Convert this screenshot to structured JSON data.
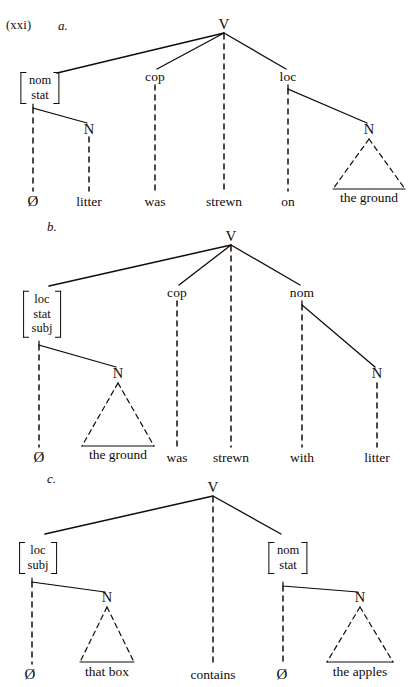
{
  "figure": {
    "example_number": "(xxi)",
    "domain": "syntax-tree-diagram",
    "ink_color": "#100c0a"
  },
  "trees": [
    {
      "letter": "a.",
      "sentence": "Ø litter was strewn on the ground",
      "root": {
        "label": "V",
        "x": 224,
        "y": 26
      },
      "nodes": [
        {
          "id": "a-nom-stat",
          "type": "feature-matrix",
          "features": [
            "nom",
            "stat"
          ],
          "x": 40,
          "y": 88
        },
        {
          "id": "a-cop",
          "type": "category",
          "label": "cop",
          "x": 155,
          "y": 79
        },
        {
          "id": "a-loc",
          "type": "category",
          "label": "loc",
          "x": 288,
          "y": 79
        },
        {
          "id": "a-n-litter",
          "type": "category",
          "label": "N",
          "x": 89,
          "y": 131
        },
        {
          "id": "a-n-ground",
          "type": "category",
          "label": "N",
          "x": 369,
          "y": 131
        }
      ],
      "terminals": [
        {
          "id": "a-t1",
          "text": "Ø",
          "x": 33,
          "y": 201,
          "triangle": false
        },
        {
          "id": "a-t2",
          "text": "litter",
          "x": 89,
          "y": 201,
          "triangle": false
        },
        {
          "id": "a-t3",
          "text": "was",
          "x": 155,
          "y": 201,
          "triangle": false
        },
        {
          "id": "a-t4",
          "text": "strewn",
          "x": 224,
          "y": 201,
          "triangle": false
        },
        {
          "id": "a-t5",
          "text": "on",
          "x": 288,
          "y": 201,
          "triangle": false
        },
        {
          "id": "a-t6",
          "text": "the ground",
          "x": 369,
          "y": 201,
          "triangle": true
        }
      ]
    },
    {
      "letter": "b.",
      "sentence": "Ø the ground was strewn with litter",
      "root": {
        "label": "V",
        "x": 231,
        "y": 238
      },
      "nodes": [
        {
          "id": "b-loc-stat-subj",
          "type": "feature-matrix",
          "features": [
            "loc",
            "stat",
            "subj"
          ],
          "x": 42,
          "y": 314
        },
        {
          "id": "b-cop",
          "type": "category",
          "label": "cop",
          "x": 177,
          "y": 295
        },
        {
          "id": "b-nom",
          "type": "category",
          "label": "nom",
          "x": 302,
          "y": 295
        },
        {
          "id": "b-n-ground",
          "type": "category",
          "label": "N",
          "x": 118,
          "y": 375
        },
        {
          "id": "b-n-litter",
          "type": "category",
          "label": "N",
          "x": 377,
          "y": 375
        }
      ],
      "terminals": [
        {
          "id": "b-t1",
          "text": "Ø",
          "x": 39,
          "y": 457,
          "triangle": false
        },
        {
          "id": "b-t2",
          "text": "the ground",
          "x": 118,
          "y": 457,
          "triangle": true
        },
        {
          "id": "b-t3",
          "text": "was",
          "x": 177,
          "y": 457,
          "triangle": false
        },
        {
          "id": "b-t4",
          "text": "strewn",
          "x": 231,
          "y": 457,
          "triangle": false
        },
        {
          "id": "b-t5",
          "text": "with",
          "x": 302,
          "y": 457,
          "triangle": false
        },
        {
          "id": "b-t6",
          "text": "litter",
          "x": 377,
          "y": 457,
          "triangle": false
        }
      ]
    },
    {
      "letter": "c.",
      "sentence": "Ø that box contains Ø the apples",
      "root": {
        "label": "V",
        "x": 213,
        "y": 489
      },
      "nodes": [
        {
          "id": "c-loc-subj",
          "type": "feature-matrix",
          "features": [
            "loc",
            "subj"
          ],
          "x": 38,
          "y": 558
        },
        {
          "id": "c-nom-stat",
          "type": "feature-matrix",
          "features": [
            "nom",
            "stat"
          ],
          "x": 288,
          "y": 558
        },
        {
          "id": "c-n-box",
          "type": "category",
          "label": "N",
          "x": 107,
          "y": 599
        },
        {
          "id": "c-n-apples",
          "type": "category",
          "label": "N",
          "x": 360,
          "y": 599
        }
      ],
      "terminals": [
        {
          "id": "c-t1",
          "text": "Ø",
          "x": 30,
          "y": 674,
          "triangle": false
        },
        {
          "id": "c-t2",
          "text": "that box",
          "x": 107,
          "y": 674,
          "triangle": true
        },
        {
          "id": "c-t3",
          "text": "contains",
          "x": 213,
          "y": 674,
          "triangle": false
        },
        {
          "id": "c-t4",
          "text": "Ø",
          "x": 282,
          "y": 674,
          "triangle": false
        },
        {
          "id": "c-t5",
          "text": "the apples",
          "x": 360,
          "y": 674,
          "triangle": true
        }
      ]
    }
  ]
}
